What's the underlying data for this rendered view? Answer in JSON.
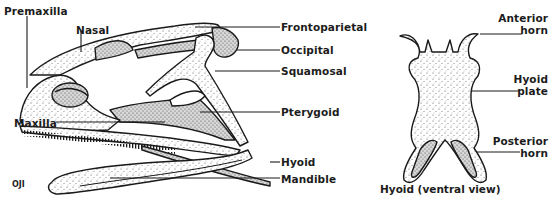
{
  "figure": {
    "colors": {
      "ink": "#1a1a1a",
      "paper": "#ffffff",
      "stipple": "#555555"
    }
  },
  "skull": {
    "labels": {
      "premaxilla": "Premaxilla",
      "nasal": "Nasal",
      "frontoparietal": "Frontoparietal",
      "occipital": "Occipital",
      "squamosal": "Squamosal",
      "pterygoid": "Pterygoid",
      "maxilla": "Maxilla",
      "hyoid": "Hyoid",
      "mandible": "Mandible"
    }
  },
  "hyoid_view": {
    "labels": {
      "anterior_horn_line1": "Anterior",
      "anterior_horn_line2": "horn",
      "hyoid_plate_line1": "Hyoid",
      "hyoid_plate_line2": "plate",
      "posterior_horn_line1": "Posterior",
      "posterior_horn_line2": "horn"
    },
    "caption": "Hyoid (ventral view)"
  },
  "credit": "OJI"
}
